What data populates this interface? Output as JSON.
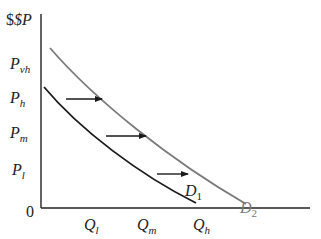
{
  "diagram": {
    "type": "demand-shift",
    "colors": {
      "axis": "#222222",
      "d1": "#1a1a1a",
      "d2": "#7a7a7a",
      "arrow": "#1a1a1a",
      "text": "#222222"
    },
    "y_axis": {
      "label": {
        "main": "$P",
        "sub": ""
      },
      "ticks": [
        {
          "main": "P",
          "sub": "vh"
        },
        {
          "main": "P",
          "sub": "h"
        },
        {
          "main": "P",
          "sub": "m"
        },
        {
          "main": "P",
          "sub": "l"
        }
      ],
      "origin": "0"
    },
    "x_axis": {
      "ticks": [
        {
          "main": "Q",
          "sub": "l"
        },
        {
          "main": "Q",
          "sub": "m"
        },
        {
          "main": "Q",
          "sub": "h"
        }
      ]
    },
    "curves": [
      {
        "id": "D1",
        "label_main": "D",
        "label_sub": "1"
      },
      {
        "id": "D2",
        "label_main": "D",
        "label_sub": "2"
      }
    ],
    "arrows": [
      {
        "from": "D1",
        "to": "D2",
        "level": "P_h"
      },
      {
        "from": "D1",
        "to": "D2",
        "level": "P_m"
      },
      {
        "from": "D1",
        "to": "D2",
        "level": "P_l"
      }
    ]
  }
}
